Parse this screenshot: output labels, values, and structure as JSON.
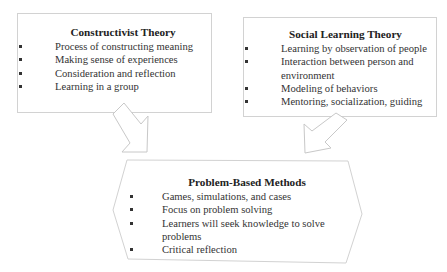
{
  "diagram": {
    "colors": {
      "border": "#d4d4d4",
      "text": "#333333",
      "background": "#ffffff"
    },
    "boxes": [
      {
        "id": "constructivist",
        "title": "Constructivist Theory",
        "items": [
          "Process of constructing meaning",
          "Making sense of experiences",
          "Consideration and reflection",
          "Learning in a group"
        ]
      },
      {
        "id": "social-learning",
        "title": "Social Learning Theory",
        "items": [
          "Learning by observation of people",
          "Interaction between person and environment",
          "Modeling of behaviors",
          "Mentoring, socialization, guiding"
        ]
      },
      {
        "id": "problem-based",
        "title": "Problem-Based Methods",
        "items": [
          "Games, simulations, and cases",
          "Focus on problem solving",
          "Learners will seek knowledge to solve problems",
          "Critical reflection"
        ]
      }
    ],
    "arrows": [
      {
        "from": "constructivist",
        "to": "problem-based",
        "icon": "arrow-down-right-icon"
      },
      {
        "from": "social-learning",
        "to": "problem-based",
        "icon": "arrow-down-left-icon"
      }
    ]
  }
}
